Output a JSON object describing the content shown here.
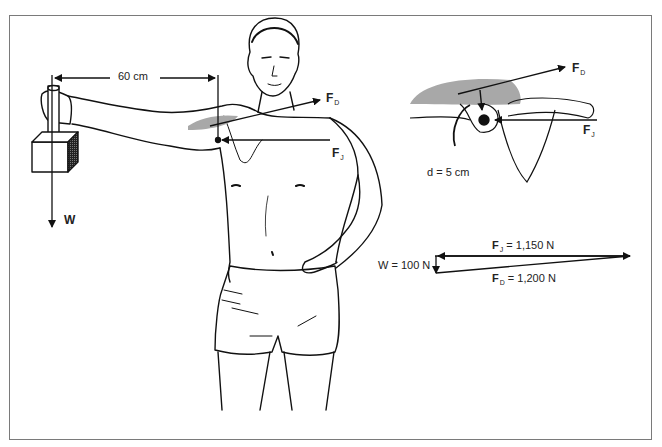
{
  "figure": {
    "colors": {
      "line": "#111111",
      "muscle_fill": "#a8a8a8",
      "frame": "#7a7a7a",
      "background": "#ffffff"
    }
  },
  "left_figure": {
    "distance_label": "60 cm",
    "weight_label": "W",
    "deltoid_force": {
      "main": "F",
      "sub": "D"
    },
    "joint_force": {
      "main": "F",
      "sub": "J"
    }
  },
  "inset": {
    "deltoid_force": {
      "main": "F",
      "sub": "D"
    },
    "joint_force": {
      "main": "F",
      "sub": "J"
    },
    "moment_arm_label": "d = 5 cm"
  },
  "force_triangle": {
    "joint": {
      "main": "F",
      "sub": "J",
      "value": " = 1,150 N"
    },
    "deltoid": {
      "main": "F",
      "sub": "D",
      "value": " = 1,200 N"
    },
    "weight_label": "W = 100 N"
  }
}
